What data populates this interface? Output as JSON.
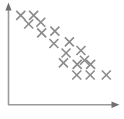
{
  "chart_data": {
    "type": "scatter",
    "title": "",
    "subtitle": "",
    "xlabel": "",
    "ylabel": "",
    "legend": [],
    "annotations": [],
    "grid": false,
    "xticks": [],
    "yticks": [],
    "xlim": [
      0,
      100
    ],
    "ylim": [
      0,
      100
    ],
    "marker": "x",
    "marker_color": "#8a8a8a",
    "marker_size": 9,
    "marker_stroke_width": 1.6,
    "relationship": "negative",
    "series": [
      {
        "name": "points",
        "points": [
          {
            "x": 11.6,
            "y": 90.5
          },
          {
            "x": 23.3,
            "y": 90.5
          },
          {
            "x": 18.8,
            "y": 81.8
          },
          {
            "x": 29.8,
            "y": 83.6
          },
          {
            "x": 30.6,
            "y": 72.9
          },
          {
            "x": 42.6,
            "y": 74.6
          },
          {
            "x": 41.7,
            "y": 62.1
          },
          {
            "x": 55.8,
            "y": 63.8
          },
          {
            "x": 52.8,
            "y": 52.5
          },
          {
            "x": 66.3,
            "y": 55.0
          },
          {
            "x": 69.5,
            "y": 45.2
          },
          {
            "x": 62.9,
            "y": 41.0
          },
          {
            "x": 75.1,
            "y": 41.0
          },
          {
            "x": 62.5,
            "y": 30.3
          },
          {
            "x": 74.7,
            "y": 30.3
          },
          {
            "x": 89.4,
            "y": 30.3
          },
          {
            "x": 50.4,
            "y": 42.5
          }
        ]
      }
    ]
  },
  "axes": {
    "color": "#9a9a9a",
    "x_axis_name": "x-axis",
    "y_axis_name": "y-axis",
    "x_arrow": "arrow-right",
    "y_arrow": "arrow-up",
    "origin_x": 8,
    "origin_y": 105,
    "x_end": 118,
    "y_end": 6
  }
}
